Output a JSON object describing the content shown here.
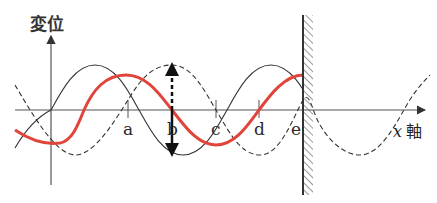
{
  "axes": {
    "y_label": "変位",
    "x_label_var": "x",
    "x_label_word": "軸"
  },
  "points": [
    {
      "label": "a",
      "x": 128
    },
    {
      "label": "b",
      "x": 172
    },
    {
      "label": "c",
      "x": 216
    },
    {
      "label": "d",
      "x": 259
    },
    {
      "label": "e",
      "x": 303
    }
  ],
  "waves": {
    "incident": {
      "style": "solid-thin",
      "color": "#333333"
    },
    "reflected": {
      "style": "dashed",
      "color": "#333333"
    },
    "composite": {
      "style": "solid-thick",
      "color": "#e0443a"
    }
  },
  "wall": {
    "label": "wall",
    "x": 303
  },
  "arrow": {
    "at": "b",
    "direction": "up-down"
  }
}
